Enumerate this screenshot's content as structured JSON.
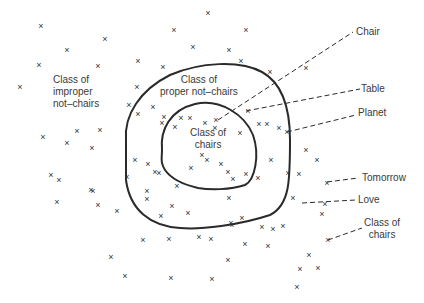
{
  "diagram": {
    "regions": {
      "improper": "Class of\nimproper\nnot–chairs",
      "proper": "Class of\nproper not–chairs",
      "chairs_inner": "Class of\nchairs"
    },
    "callouts": {
      "chair": "Chair",
      "table": "Table",
      "planet": "Planet",
      "tomorrow": "Tomorrow",
      "love": "Love",
      "class_of_chairs": "Class of\nchairs"
    },
    "colors": {
      "ink": "#2a2a2a",
      "background": "#ffffff"
    },
    "mark_glyph": "×",
    "marks": [
      [
        208,
        13
      ],
      [
        174,
        30
      ],
      [
        246,
        30
      ],
      [
        41,
        26
      ],
      [
        105,
        39
      ],
      [
        67,
        50
      ],
      [
        193,
        47
      ],
      [
        138,
        61
      ],
      [
        39,
        65
      ],
      [
        98,
        66
      ],
      [
        229,
        50
      ],
      [
        270,
        72
      ],
      [
        20,
        87
      ],
      [
        137,
        87
      ],
      [
        163,
        67
      ],
      [
        241,
        61
      ],
      [
        306,
        68
      ],
      [
        138,
        114
      ],
      [
        129,
        105
      ],
      [
        153,
        107
      ],
      [
        164,
        117
      ],
      [
        162,
        123
      ],
      [
        181,
        118
      ],
      [
        175,
        127
      ],
      [
        190,
        118
      ],
      [
        205,
        123
      ],
      [
        216,
        120
      ],
      [
        248,
        111
      ],
      [
        287,
        132
      ],
      [
        215,
        128
      ],
      [
        240,
        133
      ],
      [
        259,
        124
      ],
      [
        267,
        124
      ],
      [
        279,
        128
      ],
      [
        77,
        131
      ],
      [
        43,
        137
      ],
      [
        100,
        130
      ],
      [
        67,
        143
      ],
      [
        92,
        148
      ],
      [
        51,
        175
      ],
      [
        59,
        180
      ],
      [
        91,
        190
      ],
      [
        93,
        191
      ],
      [
        159,
        173
      ],
      [
        191,
        168
      ],
      [
        207,
        160
      ],
      [
        135,
        160
      ],
      [
        148,
        164
      ],
      [
        155,
        172
      ],
      [
        202,
        155
      ],
      [
        221,
        164
      ],
      [
        228,
        172
      ],
      [
        233,
        179
      ],
      [
        246,
        174
      ],
      [
        258,
        178
      ],
      [
        271,
        160
      ],
      [
        288,
        173
      ],
      [
        306,
        150
      ],
      [
        317,
        160
      ],
      [
        322,
        214
      ],
      [
        268,
        246
      ],
      [
        231,
        223
      ],
      [
        229,
        198
      ],
      [
        273,
        229
      ],
      [
        127,
        177
      ],
      [
        147,
        191
      ],
      [
        177,
        186
      ],
      [
        147,
        199
      ],
      [
        172,
        206
      ],
      [
        161,
        216
      ],
      [
        188,
        213
      ],
      [
        242,
        218
      ],
      [
        262,
        227
      ],
      [
        283,
        226
      ],
      [
        245,
        244
      ],
      [
        228,
        260
      ],
      [
        300,
        269
      ],
      [
        318,
        268
      ],
      [
        293,
        198
      ],
      [
        57,
        202
      ],
      [
        98,
        205
      ],
      [
        117,
        211
      ],
      [
        143,
        240
      ],
      [
        169,
        239
      ],
      [
        211,
        239
      ],
      [
        199,
        237
      ],
      [
        232,
        225
      ],
      [
        111,
        257
      ],
      [
        125,
        276
      ],
      [
        171,
        278
      ],
      [
        212,
        279
      ],
      [
        309,
        255
      ],
      [
        297,
        287
      ],
      [
        299,
        174
      ],
      [
        327,
        183
      ],
      [
        325,
        204
      ],
      [
        328,
        240
      ]
    ]
  }
}
